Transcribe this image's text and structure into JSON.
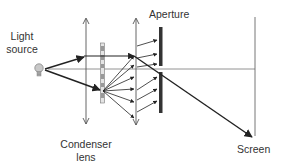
{
  "diagram": {
    "labels": {
      "light_source_line1": "Light",
      "light_source_line2": "source",
      "aperture": "Aperture",
      "condenser_line1": "Condenser",
      "condenser_line2": "lens",
      "screen": "Screen"
    },
    "components": [
      {
        "id": "light-source",
        "type": "bulb-icon"
      },
      {
        "id": "condenser-lens",
        "type": "double-arrow-line"
      },
      {
        "id": "grating",
        "type": "striped-bar"
      },
      {
        "id": "second-lens",
        "type": "double-arrow-line"
      },
      {
        "id": "aperture",
        "type": "split-thick-bar"
      },
      {
        "id": "screen",
        "type": "vertical-line"
      },
      {
        "id": "optical-axis",
        "type": "horizontal-line"
      }
    ],
    "colors": {
      "line": "#555555",
      "ray": "#222222",
      "aperture": "#333333",
      "grating_fill": "#dddddd",
      "bulb": "#bbbbbb"
    }
  }
}
